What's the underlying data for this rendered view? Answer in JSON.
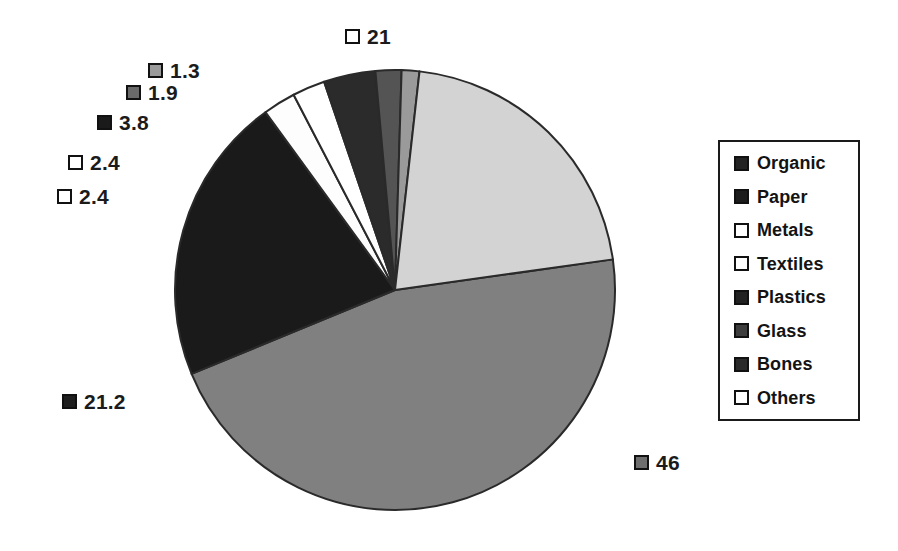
{
  "chart_data": {
    "type": "pie",
    "title": "",
    "categories": [
      "Organic",
      "Paper",
      "Metals",
      "Textiles",
      "Plastics",
      "Glass",
      "Bones",
      "Others"
    ],
    "values": [
      46,
      21.2,
      2.4,
      2.4,
      3.8,
      1.9,
      1.3,
      21
    ],
    "labels": [
      "46",
      "21.2",
      "2.4",
      "2.4",
      "3.8",
      "1.9",
      "1.3",
      "21"
    ],
    "colors": [
      "#808080",
      "#1a1a1a",
      "#fdfdfd",
      "#ffffff",
      "#2b2b2b",
      "#545454",
      "#9a9a9a",
      "#d3d3d3"
    ],
    "units": "percent",
    "legend_position": "right",
    "grid": false,
    "xlabel": "",
    "ylabel": ""
  },
  "pie": {
    "center_x": 395,
    "center_y": 290,
    "radius": 220,
    "start_angle": -8,
    "stroke": "#2a2a2a",
    "slices": [
      {
        "name": "Organic",
        "value": 46,
        "label": "46",
        "fill": "#808080"
      },
      {
        "name": "Paper",
        "value": 21.2,
        "label": "21.2",
        "fill": "#1a1a1a"
      },
      {
        "name": "Metals",
        "value": 2.4,
        "label": "2.4",
        "fill": "#fdfdfd"
      },
      {
        "name": "Textiles",
        "value": 2.4,
        "label": "2.4",
        "fill": "#ffffff"
      },
      {
        "name": "Plastics",
        "value": 3.8,
        "label": "3.8",
        "fill": "#2b2b2b"
      },
      {
        "name": "Glass",
        "value": 1.9,
        "label": "1.9",
        "fill": "#545454"
      },
      {
        "name": "Bones",
        "value": 1.3,
        "label": "1.3",
        "fill": "#9a9a9a"
      },
      {
        "name": "Others",
        "value": 21,
        "label": "21",
        "fill": "#d3d3d3"
      }
    ]
  },
  "callouts": [
    {
      "key": "others",
      "label": "21",
      "swatch": "#ffffff",
      "x": 345,
      "y": 26
    },
    {
      "key": "bones",
      "label": "1.3",
      "swatch": "#9a9a9a",
      "x": 148,
      "y": 60
    },
    {
      "key": "glass",
      "label": "1.9",
      "swatch": "#6a6a6a",
      "x": 126,
      "y": 82
    },
    {
      "key": "plastics",
      "label": "3.8",
      "swatch": "#1a1a1a",
      "x": 97,
      "y": 112
    },
    {
      "key": "metals",
      "label": "2.4",
      "swatch": "#ffffff",
      "x": 68,
      "y": 152
    },
    {
      "key": "textiles",
      "label": "2.4",
      "swatch": "#ffffff",
      "x": 57,
      "y": 186
    },
    {
      "key": "paper",
      "label": "21.2",
      "swatch": "#1f1f1f",
      "x": 62,
      "y": 391
    },
    {
      "key": "organic",
      "label": "46",
      "swatch": "#6e6e6e",
      "x": 634,
      "y": 452
    }
  ],
  "legend": {
    "items": [
      {
        "label": "Organic",
        "swatch": "#232323"
      },
      {
        "label": "Paper",
        "swatch": "#1c1c1c"
      },
      {
        "label": "Metals",
        "swatch": "#ffffff"
      },
      {
        "label": "Textiles",
        "swatch": "#ffffff"
      },
      {
        "label": "Plastics",
        "swatch": "#222222"
      },
      {
        "label": "Glass",
        "swatch": "#3d3d3d"
      },
      {
        "label": "Bones",
        "swatch": "#2a2a2a"
      },
      {
        "label": "Others",
        "swatch": "#ffffff"
      }
    ]
  }
}
